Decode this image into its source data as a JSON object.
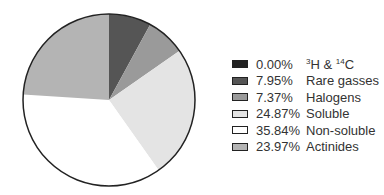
{
  "chart_data": {
    "type": "pie",
    "title": "",
    "slices": [
      {
        "label": "3H & 14C",
        "value": 0.0,
        "pct_label": "0.00%",
        "color": "#222222"
      },
      {
        "label": "Rare gasses",
        "value": 7.95,
        "pct_label": "7.95%",
        "color": "#555555"
      },
      {
        "label": "Halogens",
        "value": 7.37,
        "pct_label": "7.37%",
        "color": "#9a9a9a"
      },
      {
        "label": "Soluble",
        "value": 24.87,
        "pct_label": "24.87%",
        "color": "#e4e4e4"
      },
      {
        "label": "Non-soluble",
        "value": 35.84,
        "pct_label": "35.84%",
        "color": "#ffffff"
      },
      {
        "label": "Actinides",
        "value": 23.97,
        "pct_label": "23.97%",
        "color": "#b4b4b4"
      }
    ],
    "legend_position": "right",
    "start_angle_deg": 0,
    "direction": "clockwise"
  }
}
